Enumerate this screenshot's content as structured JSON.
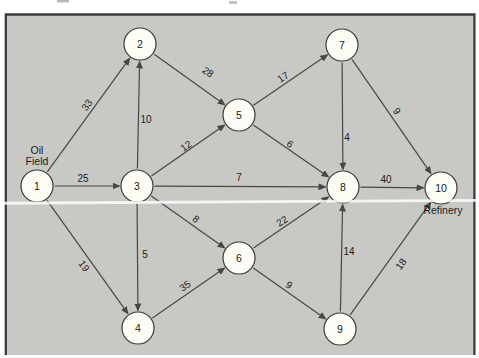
{
  "figure": {
    "title_semantic": "oil-field-to-refinery-flow-network",
    "source_label": {
      "line1": "Oil",
      "line2": "Field",
      "x": 37,
      "y1": 154,
      "y2": 165
    },
    "sink_label": {
      "text": "Refinery",
      "x": 443,
      "y": 214
    },
    "colors": {
      "background": "#c8c8c5",
      "border": "#3c3c3c",
      "node_fill": "#fcfcf4",
      "node_stroke": "#3a3a3a",
      "edge": "#474747",
      "text": "#1b1b1b"
    },
    "node_radius": 16,
    "nodes": [
      {
        "id": "1",
        "x": 37,
        "y": 186
      },
      {
        "id": "2",
        "x": 140,
        "y": 44
      },
      {
        "id": "3",
        "x": 137,
        "y": 186
      },
      {
        "id": "4",
        "x": 138,
        "y": 328
      },
      {
        "id": "5",
        "x": 239,
        "y": 115
      },
      {
        "id": "6",
        "x": 239,
        "y": 258
      },
      {
        "id": "7",
        "x": 342,
        "y": 45
      },
      {
        "id": "8",
        "x": 343,
        "y": 187
      },
      {
        "id": "9",
        "x": 340,
        "y": 329
      },
      {
        "id": "10",
        "x": 441,
        "y": 188
      }
    ],
    "edges": [
      {
        "from": "1",
        "to": "2",
        "weight": "33",
        "lx": 87,
        "ly": 105,
        "rot": -54
      },
      {
        "from": "3",
        "to": "2",
        "weight": "10",
        "lx": 146,
        "ly": 119,
        "rot": 0
      },
      {
        "from": "2",
        "to": "5",
        "weight": "28",
        "lx": 208,
        "ly": 72,
        "rot": 35
      },
      {
        "from": "1",
        "to": "3",
        "weight": "25",
        "lx": 83,
        "ly": 178,
        "rot": 0
      },
      {
        "from": "3",
        "to": "5",
        "weight": "12",
        "lx": 186,
        "ly": 146,
        "rot": -35
      },
      {
        "from": "3",
        "to": "8",
        "weight": "7",
        "lx": 239,
        "ly": 177,
        "rot": 0
      },
      {
        "from": "3",
        "to": "6",
        "weight": "8",
        "lx": 196,
        "ly": 219,
        "rot": 35
      },
      {
        "from": "3",
        "to": "4",
        "weight": "5",
        "lx": 145,
        "ly": 254,
        "rot": 0
      },
      {
        "from": "1",
        "to": "4",
        "weight": "19",
        "lx": 84,
        "ly": 266,
        "rot": 54
      },
      {
        "from": "4",
        "to": "6",
        "weight": "35",
        "lx": 185,
        "ly": 286,
        "rot": -35
      },
      {
        "from": "5",
        "to": "7",
        "weight": "17",
        "lx": 283,
        "ly": 77,
        "rot": -34
      },
      {
        "from": "5",
        "to": "8",
        "weight": "6",
        "lx": 290,
        "ly": 144,
        "rot": 35
      },
      {
        "from": "7",
        "to": "8",
        "weight": "4",
        "lx": 347,
        "ly": 137,
        "rot": 0
      },
      {
        "from": "7",
        "to": "10",
        "weight": "9",
        "lx": 397,
        "ly": 111,
        "rot": 55
      },
      {
        "from": "8",
        "to": "10",
        "weight": "40",
        "lx": 386,
        "ly": 179,
        "rot": 0
      },
      {
        "from": "6",
        "to": "8",
        "weight": "22",
        "lx": 282,
        "ly": 221,
        "rot": -34
      },
      {
        "from": "6",
        "to": "9",
        "weight": "9",
        "lx": 289,
        "ly": 285,
        "rot": 35
      },
      {
        "from": "9",
        "to": "8",
        "weight": "14",
        "lx": 349,
        "ly": 251,
        "rot": 0
      },
      {
        "from": "9",
        "to": "10",
        "weight": "18",
        "lx": 401,
        "ly": 264,
        "rot": -54
      }
    ]
  }
}
